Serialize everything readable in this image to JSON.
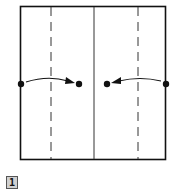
{
  "diagram": {
    "step_number": "1",
    "square": {
      "x": 20,
      "y": 6,
      "width": 146,
      "height": 154
    },
    "lines": {
      "center": {
        "type": "solid",
        "x": 94
      },
      "left_fold": {
        "type": "dashed",
        "x": 51
      },
      "right_fold": {
        "type": "dashed",
        "x": 138
      }
    },
    "points": [
      {
        "x": 21,
        "y": 84
      },
      {
        "x": 79,
        "y": 84
      },
      {
        "x": 107,
        "y": 84
      },
      {
        "x": 166,
        "y": 84
      }
    ],
    "arrows": [
      {
        "from": "left-edge",
        "to": "left-center-dot"
      },
      {
        "from": "right-edge",
        "to": "right-center-dot"
      }
    ],
    "colors": {
      "stroke": "#111111",
      "badge_bg": "#d0d0d0"
    }
  }
}
